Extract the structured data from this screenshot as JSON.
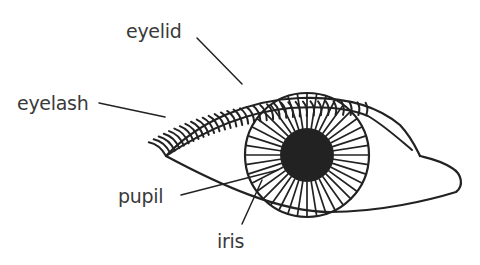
{
  "diagram": {
    "type": "labeled-illustration",
    "subject": "eye",
    "line_color": "#222222",
    "label_color": "#3a3a3a",
    "labels": [
      {
        "id": "eyelid",
        "text": "eyelid",
        "x": 126,
        "y": 22
      },
      {
        "id": "eyelash",
        "text": "eyelash",
        "x": 17,
        "y": 94
      },
      {
        "id": "pupil",
        "text": "pupil",
        "x": 118,
        "y": 187
      },
      {
        "id": "iris",
        "text": "iris",
        "x": 217,
        "y": 232
      }
    ],
    "parts": {
      "iris": {
        "cx": 307,
        "cy": 155,
        "r": 62,
        "spokes": 40
      },
      "pupil": {
        "cx": 307,
        "cy": 155,
        "r": 27
      }
    }
  }
}
